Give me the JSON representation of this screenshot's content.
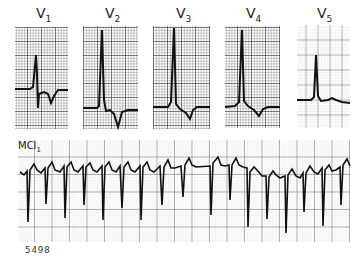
{
  "figure": {
    "leads": [
      {
        "name": "V",
        "sub": "1"
      },
      {
        "name": "V",
        "sub": "2"
      },
      {
        "name": "V",
        "sub": "3"
      },
      {
        "name": "V",
        "sub": "4"
      },
      {
        "name": "V",
        "sub": "5"
      }
    ],
    "rhythm_strip": {
      "name": "MCl",
      "sub": "1"
    },
    "figure_number": "5498"
  },
  "colors": {
    "trace": "#1a1a1a",
    "grid_major": "#444444",
    "grid_minor": "#9a9a9a",
    "paper": "#ffffff"
  }
}
